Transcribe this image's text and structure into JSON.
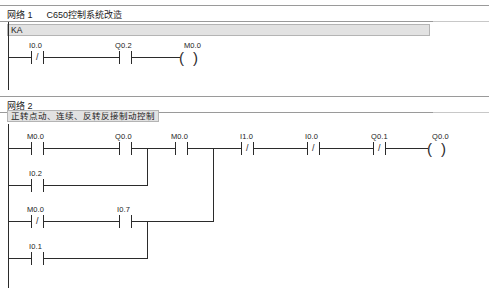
{
  "app": {
    "type": "plc-ladder-logic-editor",
    "page_background": "#ffffff",
    "line_color": "#2b2b2b",
    "comment_bar_color": "#e2e2e2",
    "header_rule_color": "#9a9a9a"
  },
  "networks": [
    {
      "id": "network-1",
      "label": "网络 1",
      "title": "C650控制系统改造",
      "comment": "KA",
      "rungs": [
        {
          "id": "rung-1-row-1",
          "elements": [
            {
              "kind": "contact",
              "type": "nc",
              "label": "I0.0",
              "glyph": "/"
            },
            {
              "kind": "contact",
              "type": "no",
              "label": "Q0.2",
              "glyph": ""
            },
            {
              "kind": "coil",
              "type": "coil",
              "label": "M0.0",
              "glyph": "( )"
            }
          ]
        }
      ]
    },
    {
      "id": "network-2",
      "label": "网络 2",
      "title": "",
      "comment": "正转点动、连续、反转反接制动控制",
      "rungs": [
        {
          "id": "rung-2-row-1",
          "elements": [
            {
              "kind": "contact",
              "type": "no",
              "label": "M0.0",
              "glyph": ""
            },
            {
              "kind": "contact",
              "type": "no",
              "label": "Q0.0",
              "glyph": ""
            },
            {
              "kind": "contact",
              "type": "no",
              "label": "M0.0",
              "glyph": ""
            },
            {
              "kind": "contact",
              "type": "nc",
              "label": "I1.0",
              "glyph": "/"
            },
            {
              "kind": "contact",
              "type": "nc",
              "label": "I0.0",
              "glyph": "/"
            },
            {
              "kind": "contact",
              "type": "nc",
              "label": "Q0.1",
              "glyph": "/"
            },
            {
              "kind": "coil",
              "type": "coil",
              "label": "Q0.0",
              "glyph": "( )"
            }
          ]
        },
        {
          "id": "rung-2-row-2",
          "elements": [
            {
              "kind": "contact",
              "type": "no",
              "label": "I0.2",
              "glyph": ""
            }
          ]
        },
        {
          "id": "rung-2-row-3",
          "elements": [
            {
              "kind": "contact",
              "type": "nc",
              "label": "M0.0",
              "glyph": "/"
            },
            {
              "kind": "contact",
              "type": "no",
              "label": "I0.7",
              "glyph": ""
            }
          ]
        },
        {
          "id": "rung-2-row-4",
          "elements": [
            {
              "kind": "contact",
              "type": "no",
              "label": "I0.1",
              "glyph": ""
            }
          ]
        }
      ]
    }
  ],
  "labels": {
    "n1_label": "网络 1",
    "n1_title": "C650控制系统改造",
    "n1_comment": "KA",
    "n2_label": "网络 2",
    "n2_comment": "正转点动、连续、反转反接制动控制",
    "r1c1": "I0.0",
    "r1c2": "Q0.2",
    "r1c3": "M0.0",
    "r2c1": "M0.0",
    "r2c2": "Q0.0",
    "r2c3": "M0.0",
    "r2c4": "I1.0",
    "r2c5": "I0.0",
    "r2c6": "Q0.1",
    "r2c7": "Q0.0",
    "r3c1": "I0.2",
    "r4c1": "M0.0",
    "r4c2": "I0.7",
    "r5c1": "I0.1"
  },
  "glyphs": {
    "slash": "/",
    "coil_open": "(",
    "coil_close": ")"
  }
}
